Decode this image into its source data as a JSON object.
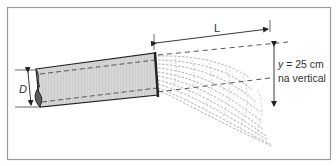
{
  "diagram": {
    "type": "physics-illustration",
    "labels": {
      "diameter": "D",
      "horizontal_distance": "L",
      "vertical_drop_var": "y",
      "vertical_drop_value": " = 25 cm",
      "vertical_note": "na vertical"
    },
    "colors": {
      "frame": "#9a9a9a",
      "pipe_fill": "#d4d4d4",
      "pipe_outline": "#222222",
      "pipe_end_cap": "#5a5a5a",
      "dashed_lines": "#555555",
      "water_jet": "#9c9c9c",
      "text": "#333333"
    }
  }
}
